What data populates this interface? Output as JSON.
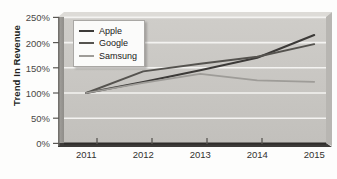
{
  "chart_data": {
    "type": "line",
    "title": "",
    "xlabel": "",
    "ylabel": "Trend In Revenue",
    "categories": [
      "2011",
      "2012",
      "2013",
      "2014",
      "2015"
    ],
    "x": [
      2011,
      2012,
      2013,
      2014,
      2015
    ],
    "ylim": [
      0,
      250
    ],
    "y_ticks": [
      "0%",
      "50%",
      "100%",
      "150%",
      "200%",
      "250%"
    ],
    "y_tick_values": [
      0,
      50,
      100,
      150,
      200,
      250
    ],
    "grid": true,
    "legend_position": "top-left",
    "series": [
      {
        "name": "Apple",
        "color": "#3c3a38",
        "values": [
          100,
          122,
          145,
          170,
          215
        ]
      },
      {
        "name": "Google",
        "color": "#55534f",
        "values": [
          100,
          143,
          158,
          172,
          197
        ]
      },
      {
        "name": "Samsung",
        "color": "#9e9c98",
        "values": [
          100,
          120,
          138,
          125,
          122
        ]
      }
    ]
  },
  "axes": {
    "y_title": "Trend In Revenue"
  },
  "legend": {
    "entries": [
      {
        "label": "Apple"
      },
      {
        "label": "Google"
      },
      {
        "label": "Samsung"
      }
    ]
  },
  "colors": {
    "plot_background": "#c9c7c3",
    "wall_shadow": "#8e8c88",
    "gridline": "#f2f1ef",
    "axis_line": "#3a3836",
    "page_background": "#fdfdfc"
  }
}
